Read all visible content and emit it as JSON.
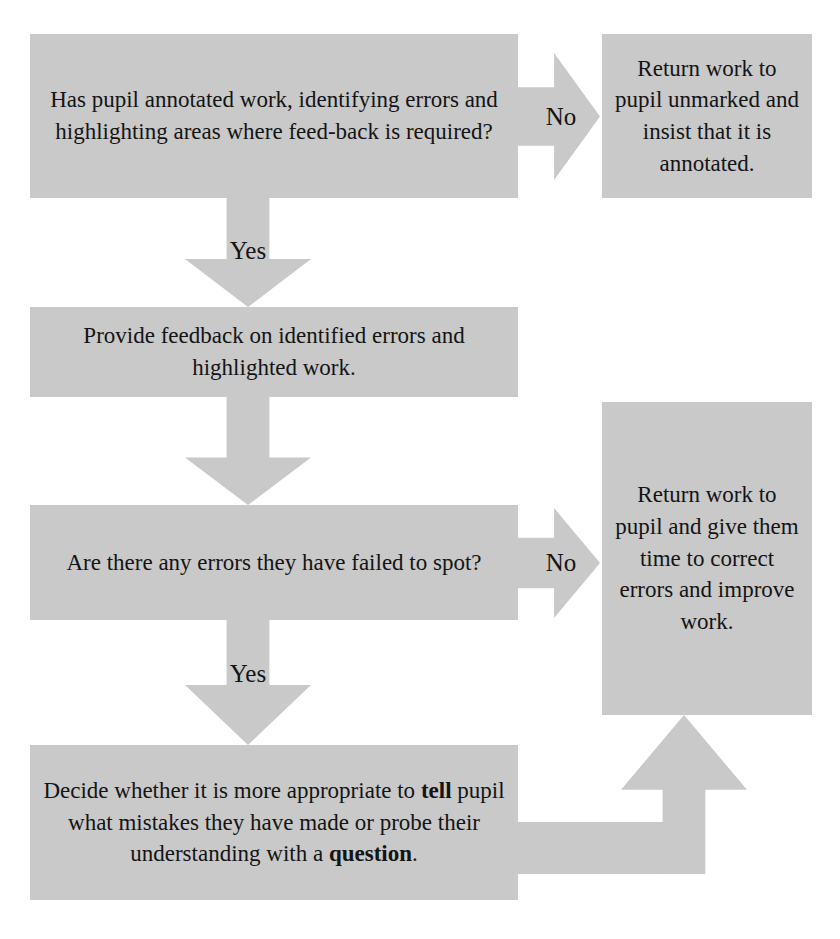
{
  "diagram": {
    "fill_color": "#c9c9c9",
    "text_color": "#141414",
    "background_color": "#ffffff",
    "nodes": {
      "question_annotated": "Has pupil annotated work, identifying errors and highlighting areas where feed-back is required?",
      "return_unmarked": "Return work to pupil unmarked and insist that it is annotated.",
      "provide_feedback": "Provide feedback on identified errors and highlighted work.",
      "question_missed_errors": "Are there any errors they have failed to spot?",
      "return_correct_improve": "Return work to pupil and give them time to correct errors and improve work.",
      "decide_tell_or_question_parts": {
        "p1": "Decide whether it is more appropriate to ",
        "b1": "tell",
        "p2": " pupil what mistakes they have made or probe their understanding with a ",
        "b2": "question",
        "p3": "."
      }
    },
    "edges": {
      "no_1": "No",
      "yes_1": "Yes",
      "no_2": "No",
      "yes_2": "Yes",
      "loop_back": ""
    }
  }
}
